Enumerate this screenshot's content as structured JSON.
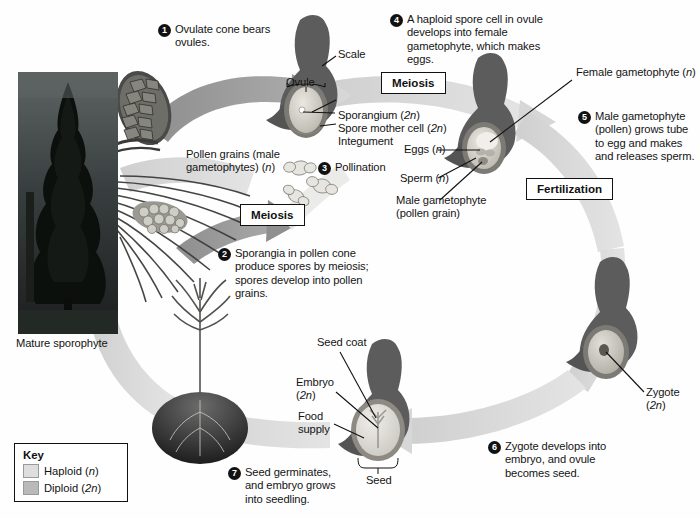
{
  "diagram": {
    "photo_caption": "Mature sporophyte",
    "steps": [
      {
        "num": "1",
        "text": "Ovulate cone bears ovules."
      },
      {
        "num": "2",
        "text": "Sporangia in pollen cone produce spores by meiosis; spores develop into pollen grains."
      },
      {
        "num": "3",
        "text": "Pollination"
      },
      {
        "num": "4",
        "text": "A haploid spore cell in ovule develops into female gametophyte, which makes eggs."
      },
      {
        "num": "5",
        "text": "Male gametophyte (pollen) grows tube to egg and makes and releases sperm."
      },
      {
        "num": "6",
        "text": "Zygote develops into embryo, and ovule becomes seed."
      },
      {
        "num": "7",
        "text": "Seed germinates, and embryo grows into seedling."
      }
    ],
    "process_boxes": [
      {
        "label": "Meiosis"
      },
      {
        "label": "Meiosis"
      },
      {
        "label": "Fertilization"
      }
    ],
    "labels": {
      "scale": "Scale",
      "ovule": "Ovule",
      "sporangium": "Sporangium (2n)",
      "spore_mother_cell": "Spore mother cell (2n)",
      "integument": "Integument",
      "pollen_grains": "Pollen grains (male gametophytes) (n)",
      "female_gametophyte": "Female gametophyte (n)",
      "eggs": "Eggs (n)",
      "sperm": "Sperm (n)",
      "male_gametophyte": "Male gametophyte (pollen grain)",
      "zygote": "Zygote (2n)",
      "seed_coat": "Seed coat",
      "embryo": "Embryo (2n)",
      "food_supply": "Food supply",
      "seed": "Seed"
    },
    "key": {
      "title": "Key",
      "entries": [
        {
          "label": "Haploid (n)",
          "color": "#dedede"
        },
        {
          "label": "Diploid (2n)",
          "color": "#b9b9b9"
        }
      ]
    },
    "colors": {
      "haploid_band": "#d9d9d9",
      "diploid_band": "#9d9d9d",
      "dark_scale": "#5a5a5a",
      "text": "#141414"
    }
  }
}
